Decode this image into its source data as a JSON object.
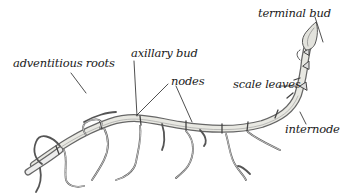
{
  "diagram": {
    "labels": [
      {
        "id": "terminal-bud",
        "text": "terminal bud"
      },
      {
        "id": "adventitious-roots",
        "text": "adventitious roots"
      },
      {
        "id": "axillary-bud",
        "text": "axillary bud"
      },
      {
        "id": "nodes",
        "text": "nodes"
      },
      {
        "id": "scale-leaves",
        "text": "scale leaves"
      },
      {
        "id": "internode",
        "text": "internode"
      }
    ],
    "colors": {
      "ink": "#1a1a1a",
      "stem_fill": "#e6e6e0",
      "stem_outline": "#555555",
      "background": "#ffffff"
    }
  }
}
